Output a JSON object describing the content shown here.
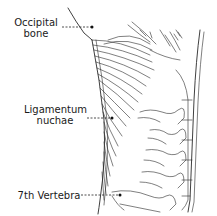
{
  "figure": {
    "labels": [
      {
        "id": "occipital-bone",
        "lines": [
          "Occipital",
          "bone"
        ]
      },
      {
        "id": "ligamentum-nuchae",
        "lines": [
          "Ligamentum",
          "nuchae"
        ]
      },
      {
        "id": "seventh-vertebra",
        "lines": [
          "7th Vertebra"
        ]
      }
    ]
  },
  "colors": {
    "background": "#ffffff",
    "ink": "#2a2a2a"
  }
}
